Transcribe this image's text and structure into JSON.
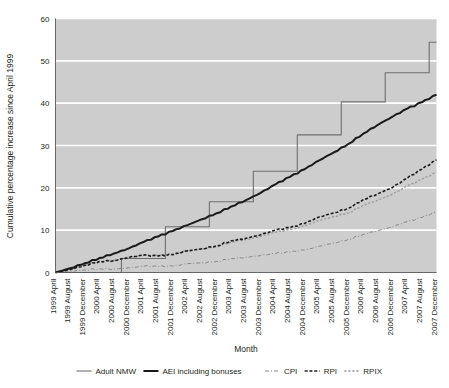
{
  "chart_data": {
    "type": "line",
    "title": "",
    "xlabel": "Month",
    "ylabel": "Cumulative percentage increase since April 1999",
    "ylim": [
      0,
      60
    ],
    "yticks": [
      0,
      10,
      20,
      30,
      40,
      50,
      60
    ],
    "grid": true,
    "legend_position": "bottom",
    "background": "#cdcdcd",
    "gridline_color": "#ffffff",
    "categories": [
      "1999 April",
      "1999 August",
      "1999 December",
      "2000 April",
      "2000 August",
      "2000 December",
      "2001 April",
      "2001 August",
      "2001 December",
      "2002 April",
      "2002 August",
      "2002 December",
      "2003 April",
      "2003 August",
      "2003 December",
      "2004 April",
      "2004 August",
      "2004 December",
      "2005 April",
      "2005 August",
      "2005 December",
      "2006 April",
      "2006 August",
      "2006 December",
      "2007 April",
      "2007 August",
      "2007 December"
    ],
    "series": [
      {
        "name": "Adult NMW",
        "style": "solid-thin",
        "color": "#6f6f6f",
        "width": 1.1,
        "step": true,
        "values": [
          0,
          0,
          0,
          0,
          0,
          0,
          0,
          0,
          0,
          0,
          0,
          0,
          0,
          0,
          0,
          0,
          0,
          0,
          0,
          0,
          0,
          0,
          0,
          0,
          0,
          0,
          0
        ],
        "monthly_values": [
          0,
          0,
          0,
          0,
          0,
          0,
          0,
          0,
          0,
          0,
          0,
          0,
          0,
          0,
          0,
          0,
          0,
          0,
          0,
          0,
          0,
          0,
          0,
          0,
          0,
          0,
          0,
          0,
          0,
          0,
          0,
          0,
          0,
          0,
          0,
          0,
          0,
          0,
          0,
          0,
          0,
          0,
          0,
          0,
          0,
          0,
          0,
          0,
          0,
          0,
          0,
          0,
          0,
          0,
          0,
          0,
          0,
          0,
          0,
          0,
          0,
          0,
          0,
          0,
          0,
          0,
          0,
          0,
          0,
          0,
          0,
          0,
          0,
          0,
          0,
          0,
          0,
          0,
          0,
          0,
          0,
          0,
          0,
          0,
          0,
          0,
          0,
          0,
          0,
          0,
          0,
          0,
          0,
          0,
          0,
          0,
          0,
          0,
          0,
          0,
          0,
          0,
          0,
          0,
          0,
          0,
          0,
          0
        ],
        "steps": [
          {
            "month": "1999 April",
            "value": 0.0
          },
          {
            "month": "2000 October",
            "value": 3.3
          },
          {
            "month": "2001 October",
            "value": 10.8
          },
          {
            "month": "2002 October",
            "value": 16.7
          },
          {
            "month": "2003 October",
            "value": 23.9
          },
          {
            "month": "2004 October",
            "value": 32.5
          },
          {
            "month": "2005 October",
            "value": 40.3
          },
          {
            "month": "2006 October",
            "value": 47.2
          },
          {
            "month": "2007 October",
            "value": 54.4
          }
        ]
      },
      {
        "name": "AEI including bonuses",
        "style": "solid-thick",
        "color": "#1a1a1a",
        "width": 2.0,
        "values": [
          0.0,
          1.0,
          2.2,
          3.4,
          4.5,
          5.7,
          7.2,
          8.5,
          9.8,
          11.2,
          12.6,
          14.0,
          15.6,
          17.1,
          18.8,
          20.8,
          22.6,
          24.4,
          26.5,
          28.4,
          30.4,
          32.8,
          34.9,
          36.8,
          38.7,
          40.2,
          42.0
        ]
      },
      {
        "name": "CPI",
        "style": "dash-dot",
        "color": "#8a8a8a",
        "width": 1.0,
        "values": [
          0.0,
          0.3,
          0.6,
          0.9,
          0.8,
          1.1,
          1.5,
          1.4,
          1.5,
          2.1,
          2.3,
          2.6,
          3.3,
          3.6,
          4.0,
          4.5,
          4.8,
          5.3,
          6.2,
          7.0,
          7.8,
          9.0,
          9.9,
          10.8,
          12.0,
          13.0,
          14.3
        ]
      },
      {
        "name": "RPI",
        "style": "dashed-bold",
        "color": "#1a1a1a",
        "width": 1.6,
        "values": [
          0.0,
          0.7,
          1.7,
          2.6,
          2.8,
          3.6,
          4.1,
          3.9,
          4.2,
          5.1,
          5.6,
          6.3,
          7.5,
          8.1,
          8.9,
          10.0,
          10.6,
          11.6,
          13.1,
          14.1,
          15.2,
          17.2,
          18.6,
          20.1,
          22.3,
          24.4,
          26.6
        ]
      },
      {
        "name": "RPIX",
        "style": "dotted",
        "color": "#9a9a9a",
        "width": 1.3,
        "values": [
          0.0,
          0.8,
          1.8,
          2.7,
          2.9,
          3.5,
          4.0,
          4.0,
          4.3,
          5.2,
          5.6,
          6.1,
          7.2,
          7.8,
          8.5,
          9.5,
          10.1,
          11.0,
          12.3,
          13.2,
          14.1,
          15.9,
          17.1,
          18.5,
          20.4,
          22.0,
          23.6
        ]
      }
    ],
    "legend": [
      {
        "label": "Adult NMW",
        "style": "solid-thin",
        "color": "#6f6f6f"
      },
      {
        "label": "AEI including bonuses",
        "style": "solid-thick",
        "color": "#1a1a1a"
      },
      {
        "label": "CPI",
        "style": "dash-dot",
        "color": "#8a8a8a"
      },
      {
        "label": "RPI",
        "style": "dashed-bold",
        "color": "#1a1a1a"
      },
      {
        "label": "RPIX",
        "style": "dotted",
        "color": "#9a9a9a"
      }
    ]
  }
}
